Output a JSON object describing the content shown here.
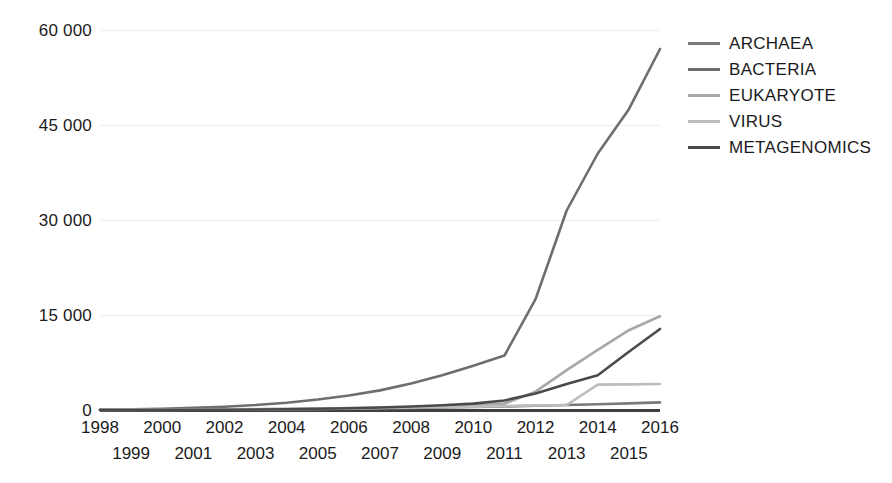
{
  "chart_data": {
    "type": "line",
    "title": "",
    "subtitle": "",
    "xlabel": "",
    "ylabel": "",
    "x": [
      1998,
      1999,
      2000,
      2001,
      2002,
      2003,
      2004,
      2005,
      2006,
      2007,
      2008,
      2009,
      2010,
      2011,
      2012,
      2013,
      2014,
      2015,
      2016
    ],
    "x_tick_labels_top": [
      "1998",
      "2000",
      "2002",
      "2004",
      "2006",
      "2008",
      "2010",
      "2012",
      "2014",
      "2016"
    ],
    "x_tick_labels_bottom": [
      "1999",
      "2001",
      "2003",
      "2005",
      "2007",
      "2009",
      "2011",
      "2013",
      "2015"
    ],
    "y_tick_labels": [
      "0",
      "15 000",
      "30 000",
      "45 000",
      "60 000"
    ],
    "y_ticks": [
      0,
      15000,
      30000,
      45000,
      60000
    ],
    "ylim": [
      0,
      60000
    ],
    "xlim": [
      1998,
      2016
    ],
    "grid": true,
    "grid_axis": "y",
    "legend_position": "right",
    "series": [
      {
        "name": "ARCHAEA",
        "color": "#7a7a7a",
        "values": [
          20,
          30,
          45,
          60,
          80,
          105,
          135,
          170,
          210,
          260,
          320,
          390,
          470,
          560,
          660,
          780,
          900,
          1050,
          1200
        ]
      },
      {
        "name": "BACTERIA",
        "color": "#6e6e6e",
        "values": [
          60,
          110,
          200,
          330,
          520,
          780,
          1150,
          1650,
          2300,
          3100,
          4200,
          5500,
          7000,
          8600,
          17500,
          31500,
          40500,
          47500,
          57000
        ]
      },
      {
        "name": "EUKARYOTE",
        "color": "#a8a8a8",
        "values": [
          10,
          15,
          25,
          40,
          60,
          90,
          130,
          180,
          250,
          330,
          430,
          560,
          720,
          1000,
          2900,
          6300,
          9500,
          12600,
          14800
        ]
      },
      {
        "name": "VIRUS",
        "color": "#bdbdbd",
        "values": [
          30,
          45,
          65,
          90,
          120,
          155,
          195,
          240,
          290,
          345,
          405,
          470,
          540,
          615,
          700,
          790,
          4000,
          4050,
          4100
        ]
      },
      {
        "name": "METAGENOMICS",
        "color": "#4a4a4a",
        "values": [
          5,
          10,
          18,
          30,
          50,
          80,
          125,
          190,
          280,
          400,
          560,
          760,
          1010,
          1500,
          2600,
          4100,
          5500,
          9200,
          12800
        ]
      }
    ]
  },
  "legend": {
    "items": [
      {
        "label": "ARCHAEA"
      },
      {
        "label": "BACTERIA"
      },
      {
        "label": "EUKARYOTE"
      },
      {
        "label": "VIRUS"
      },
      {
        "label": "METAGENOMICS"
      }
    ]
  }
}
